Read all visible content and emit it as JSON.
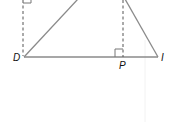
{
  "figure": {
    "type": "geometry-diagram",
    "colors": {
      "line": "#8a8a8a",
      "dash": "#555555",
      "text": "#111111",
      "background": "#ffffff"
    },
    "points": {
      "D": {
        "label": "D"
      },
      "P": {
        "label": "P"
      },
      "I": {
        "label": "I"
      }
    },
    "segments": [
      {
        "name": "base",
        "from": "D",
        "to": "I",
        "style": "solid"
      },
      {
        "name": "left-side",
        "from": "D",
        "to": "top-left",
        "style": "solid"
      },
      {
        "name": "right-side",
        "from": "I",
        "to": "top-right",
        "style": "solid"
      },
      {
        "name": "left-altitude",
        "from": "D",
        "to": "top",
        "style": "dashed"
      },
      {
        "name": "altitude-P",
        "from": "P",
        "to": "top",
        "style": "dashed"
      }
    ],
    "right_angle_marks": [
      "top of left altitude",
      "at P"
    ]
  }
}
